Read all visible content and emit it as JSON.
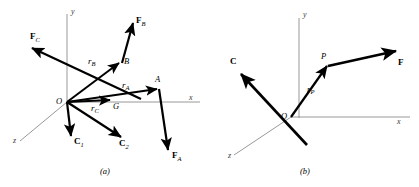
{
  "figure": {
    "background": "#ffffff",
    "vector_color": "#000000",
    "axis_color": "#8c8c8c",
    "panels": [
      {
        "id": "panel-a",
        "caption": "(a)",
        "axes": [
          {
            "name": "y-axis",
            "label": "y"
          },
          {
            "name": "x-axis",
            "label": "x"
          },
          {
            "name": "z-axis",
            "label": "z"
          }
        ],
        "origin_label": "O",
        "points": [
          {
            "name": "point-a",
            "label": "A"
          },
          {
            "name": "point-b",
            "label": "B"
          },
          {
            "name": "point-g",
            "label": "G"
          }
        ],
        "position_vectors": [
          {
            "name": "position-vector-ra",
            "symbol": "r",
            "sub": "A"
          },
          {
            "name": "position-vector-rb",
            "symbol": "r",
            "sub": "B"
          },
          {
            "name": "position-vector-rc",
            "symbol": "r",
            "sub": "C"
          }
        ],
        "force_vectors": [
          {
            "name": "force-vector-fa",
            "symbol": "F",
            "sub": "A"
          },
          {
            "name": "force-vector-fb",
            "symbol": "F",
            "sub": "B"
          },
          {
            "name": "force-vector-fc",
            "symbol": "F",
            "sub": "C"
          }
        ],
        "couple_vectors": [
          {
            "name": "couple-vector-c1",
            "symbol": "C",
            "sub": "1"
          },
          {
            "name": "couple-vector-c2",
            "symbol": "C",
            "sub": "2"
          }
        ]
      },
      {
        "id": "panel-b",
        "caption": "(b)",
        "axes": [
          {
            "name": "y-axis",
            "label": "y"
          },
          {
            "name": "x-axis",
            "label": "x"
          },
          {
            "name": "z-axis",
            "label": "z"
          }
        ],
        "origin_label": "O",
        "points": [
          {
            "name": "point-p",
            "label": "P"
          }
        ],
        "position_vectors": [
          {
            "name": "position-vector-rp",
            "symbol": "r",
            "sub": "P"
          }
        ],
        "force_vectors": [
          {
            "name": "resultant-force-vector",
            "symbol": "F",
            "sub": ""
          }
        ],
        "couple_vectors": [
          {
            "name": "resultant-couple-vector",
            "symbol": "C",
            "sub": ""
          }
        ]
      }
    ]
  }
}
